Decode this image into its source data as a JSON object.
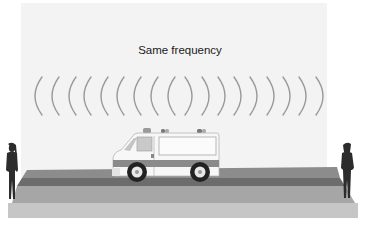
{
  "diagram": {
    "title": "Same frequency",
    "colors": {
      "background": "#ffffff",
      "panel": "#f3f3f3",
      "wave": "#9a9a9a",
      "road_top": "#8c8c8c",
      "road_stripe": "#6c6c6c",
      "road_mid": "#a6a6a6",
      "road_front": "#c6c6c6",
      "silhouette": "#2c2c2c",
      "vehicle_body": "#f7f7f7",
      "vehicle_stripe": "#8a8a8a",
      "wheel": "#222222"
    },
    "waves": {
      "left_count": 9,
      "right_count": 9,
      "left_x": [
        35,
        52,
        69,
        84,
        101,
        117,
        134,
        151,
        168
      ],
      "right_x": [
        185,
        202,
        218,
        234,
        250,
        267,
        283,
        299,
        316
      ]
    },
    "elements": {
      "source": "ambulance",
      "observer_left": "person-silhouette",
      "observer_right": "person-silhouette"
    }
  }
}
